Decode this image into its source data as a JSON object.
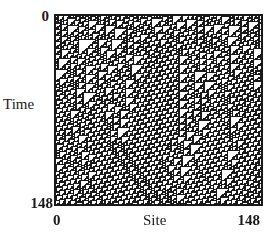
{
  "diagram": {
    "type": "cellular-automaton-spacetime",
    "rule": 110,
    "width_cells": 149,
    "height_cells": 149,
    "seed": 9137,
    "initial_density": 0.5,
    "colors": {
      "on": "#1a1a1a",
      "off": "#ffffff",
      "frame": "#1a1a1a"
    }
  },
  "axes": {
    "y_label": "Time",
    "x_label": "Site",
    "y_ticks": {
      "top": "0",
      "bottom": "148"
    },
    "x_ticks": {
      "left": "0",
      "right": "148"
    }
  }
}
